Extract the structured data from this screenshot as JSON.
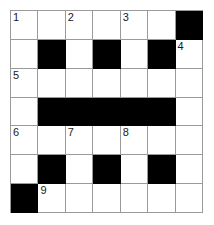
{
  "puzzle": {
    "type": "crossword-grid",
    "rows": 7,
    "columns": 7,
    "colors": {
      "block": "#000000",
      "open": "#ffffff",
      "gridline": "#9a9a9a",
      "number": "#1a1a1a"
    },
    "cells": [
      [
        {
          "block": false,
          "number": "1"
        },
        {
          "block": false,
          "number": ""
        },
        {
          "block": false,
          "number": "2"
        },
        {
          "block": false,
          "number": ""
        },
        {
          "block": false,
          "number": "3"
        },
        {
          "block": false,
          "number": ""
        },
        {
          "block": true,
          "number": ""
        }
      ],
      [
        {
          "block": false,
          "number": ""
        },
        {
          "block": true,
          "number": ""
        },
        {
          "block": false,
          "number": ""
        },
        {
          "block": true,
          "number": ""
        },
        {
          "block": false,
          "number": ""
        },
        {
          "block": true,
          "number": ""
        },
        {
          "block": false,
          "number": "4"
        }
      ],
      [
        {
          "block": false,
          "number": "5"
        },
        {
          "block": false,
          "number": ""
        },
        {
          "block": false,
          "number": ""
        },
        {
          "block": false,
          "number": ""
        },
        {
          "block": false,
          "number": ""
        },
        {
          "block": false,
          "number": ""
        },
        {
          "block": false,
          "number": ""
        }
      ],
      [
        {
          "block": false,
          "number": ""
        },
        {
          "block": true,
          "number": ""
        },
        {
          "block": true,
          "number": ""
        },
        {
          "block": true,
          "number": ""
        },
        {
          "block": true,
          "number": ""
        },
        {
          "block": true,
          "number": ""
        },
        {
          "block": false,
          "number": ""
        }
      ],
      [
        {
          "block": false,
          "number": "6"
        },
        {
          "block": false,
          "number": ""
        },
        {
          "block": false,
          "number": "7"
        },
        {
          "block": false,
          "number": ""
        },
        {
          "block": false,
          "number": "8"
        },
        {
          "block": false,
          "number": ""
        },
        {
          "block": false,
          "number": ""
        }
      ],
      [
        {
          "block": false,
          "number": ""
        },
        {
          "block": true,
          "number": ""
        },
        {
          "block": false,
          "number": ""
        },
        {
          "block": true,
          "number": ""
        },
        {
          "block": false,
          "number": ""
        },
        {
          "block": true,
          "number": ""
        },
        {
          "block": false,
          "number": ""
        }
      ],
      [
        {
          "block": true,
          "number": ""
        },
        {
          "block": false,
          "number": "9"
        },
        {
          "block": false,
          "number": ""
        },
        {
          "block": false,
          "number": ""
        },
        {
          "block": false,
          "number": ""
        },
        {
          "block": false,
          "number": ""
        },
        {
          "block": false,
          "number": ""
        }
      ]
    ]
  }
}
